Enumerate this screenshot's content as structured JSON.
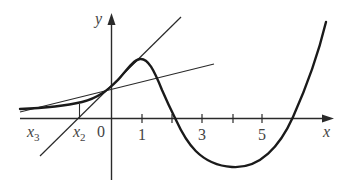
{
  "diagram": {
    "title": "",
    "colors": {
      "curve": "#1a1a1a",
      "axes": "#2a2a2a",
      "tangent": "#2a2a2a",
      "labels": "#444444",
      "background": "#ffffff"
    },
    "axes": {
      "x_label": "x",
      "y_label": "y",
      "origin_label": "0",
      "x_ticks": [
        {
          "value": 1,
          "label": "1"
        },
        {
          "value": 2,
          "label": ""
        },
        {
          "value": 3,
          "label": "3"
        },
        {
          "value": 4,
          "label": ""
        },
        {
          "value": 5,
          "label": "5"
        }
      ]
    },
    "points": [
      {
        "name": "x2",
        "base": "x",
        "subscript": "2"
      },
      {
        "name": "x3",
        "base": "x",
        "subscript": "3"
      }
    ],
    "elements": [
      {
        "type": "curve",
        "name": "function-curve",
        "note": "local max near x=1, crosses x-axis near x=2.2 and x=6, local min near x=4"
      },
      {
        "type": "line",
        "name": "tangent-line-1",
        "note": "steep tangent at curve near x=0.8, crosses x-axis at x2"
      },
      {
        "type": "line",
        "name": "tangent-line-2",
        "note": "shallow tangent at curve point above x2, crosses x-axis at x3"
      },
      {
        "type": "segment",
        "name": "vertical-guide",
        "note": "from x2 on axis up to curve"
      }
    ]
  }
}
